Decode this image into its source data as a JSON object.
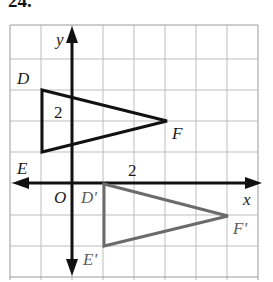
{
  "problem": {
    "number": "24."
  },
  "figure": {
    "type": "coordinate-grid-transformation",
    "background": "#ffffff",
    "grid": {
      "visible": true,
      "color": "#b8b8b8",
      "border_color": "#9a9a9a",
      "spacing_px": 31,
      "left_px": 10,
      "top_px": 25,
      "columns": 8,
      "rows": 8
    },
    "axes": {
      "color": "#111111",
      "x_axis": {
        "label": "x",
        "arrow_left": true,
        "arrow_right": true,
        "y_px": 183
      },
      "y_axis": {
        "label": "y",
        "arrow_up": true,
        "arrow_down": true,
        "x_px": 72
      },
      "origin_label": "O"
    },
    "tick_labels": [
      {
        "text": "2",
        "axis": "y",
        "x_px": 60,
        "y_px": 118
      },
      {
        "text": "2",
        "axis": "x",
        "x_px": 133,
        "y_px": 175
      }
    ],
    "shapes": [
      {
        "name": "triangle-DEF",
        "role": "preimage",
        "stroke": "#121212",
        "stroke_width": 3,
        "fill": "none",
        "vertices": [
          {
            "label": "D",
            "x_px": 42,
            "y_px": 90,
            "label_x_px": 19,
            "label_y_px": 84
          },
          {
            "label": "E",
            "x_px": 42,
            "y_px": 152,
            "label_x_px": 19,
            "label_y_px": 174
          },
          {
            "label": "F",
            "x_px": 167,
            "y_px": 121,
            "label_x_px": 172,
            "label_y_px": 139
          }
        ]
      },
      {
        "name": "triangle-D-prime-E-prime-F-prime",
        "role": "image",
        "stroke": "#6b6b6b",
        "stroke_width": 3,
        "fill": "none",
        "vertices": [
          {
            "label": "D'",
            "x_px": 104,
            "y_px": 184,
            "label_x_px": 82,
            "label_y_px": 203
          },
          {
            "label": "E'",
            "x_px": 104,
            "y_px": 246,
            "label_x_px": 84,
            "label_y_px": 265
          },
          {
            "label": "F'",
            "x_px": 228,
            "y_px": 216,
            "label_x_px": 233,
            "label_y_px": 234
          }
        ]
      }
    ]
  }
}
